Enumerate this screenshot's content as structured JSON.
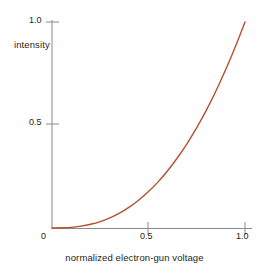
{
  "chart_data": {
    "type": "line",
    "title": "",
    "subtitle": "",
    "xlabel": "normalized electron-gun voltage",
    "ylabel": "intensity",
    "xlim": [
      0,
      1.0
    ],
    "ylim": [
      0,
      1.0
    ],
    "grid": false,
    "legend": null,
    "legend_position": "none",
    "xticks": [
      0,
      0.5,
      1.0
    ],
    "xticklabels": [
      "0",
      "0.5",
      "1.0"
    ],
    "yticks": [
      0.5,
      1.0
    ],
    "yticklabels": [
      "0.5",
      "1.0"
    ],
    "origin_label": "0",
    "series": [
      {
        "name": "gamma response",
        "color": "#b5502f",
        "relation": "intensity = voltage^2.5",
        "x": [
          0.0,
          0.05,
          0.1,
          0.15,
          0.2,
          0.25,
          0.3,
          0.35,
          0.4,
          0.45,
          0.5,
          0.55,
          0.6,
          0.65,
          0.7,
          0.75,
          0.8,
          0.85,
          0.9,
          0.95,
          1.0
        ],
        "values": [
          0.0,
          0.001,
          0.003,
          0.009,
          0.018,
          0.031,
          0.049,
          0.072,
          0.101,
          0.136,
          0.177,
          0.224,
          0.279,
          0.341,
          0.41,
          0.487,
          0.572,
          0.666,
          0.769,
          0.88,
          1.0
        ]
      }
    ]
  },
  "axes": {
    "y_label": "intensity",
    "x_label": "normalized electron-gun voltage",
    "y_tick_1": "1.0",
    "y_tick_05": "0.5",
    "x_tick_0": "0",
    "x_tick_05": "0.5",
    "x_tick_1": "1.0"
  },
  "colors": {
    "curve": "#b5502f",
    "axis": "#8a8a8a",
    "text": "#231f20",
    "background": "#ffffff"
  }
}
